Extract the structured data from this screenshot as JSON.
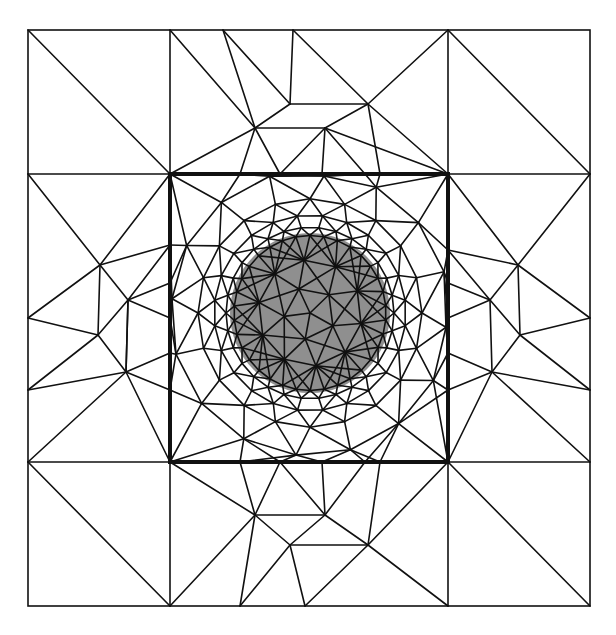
{
  "diagram": {
    "kind": "triangular finite-element mesh",
    "colors": {
      "background": "#ffffff",
      "edges": "#111111",
      "inclusion_fill": "#8f8f8f"
    },
    "regions": [
      {
        "name": "outer-domain",
        "style": "thin outline"
      },
      {
        "name": "inner-block",
        "style": "bold outline"
      },
      {
        "name": "circular-inclusion",
        "style": "gray fill, densely refined"
      }
    ],
    "text_labels": []
  }
}
